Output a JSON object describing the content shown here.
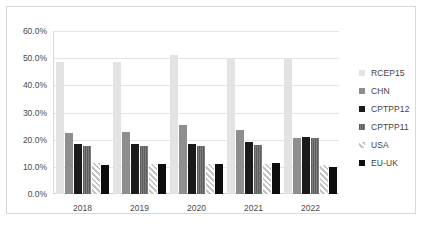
{
  "chart_data": {
    "type": "bar",
    "title": "",
    "xlabel": "",
    "ylabel": "",
    "categories": [
      "2018",
      "2019",
      "2020",
      "2021",
      "2022"
    ],
    "ylim": [
      0,
      60
    ],
    "ytick_values": [
      0,
      10,
      20,
      30,
      40,
      50,
      60
    ],
    "ytick_labels": [
      "0.0%",
      "10.0%",
      "20.0%",
      "30.0%",
      "40.0%",
      "50.0%",
      "60.0%"
    ],
    "grid": true,
    "legend_position": "right",
    "value_format": "percent",
    "series": [
      {
        "name": "RCEP15",
        "color": "#e3e3e3",
        "values": [
          48.5,
          48.5,
          51.0,
          50.0,
          50.0
        ]
      },
      {
        "name": "CHN",
        "color": "#8e8e8e",
        "values": [
          22.5,
          23.0,
          25.5,
          23.5,
          20.5
        ]
      },
      {
        "name": "CPTPP12",
        "color": "#1a1a1a",
        "values": [
          18.5,
          18.5,
          18.5,
          19.0,
          21.0
        ]
      },
      {
        "name": "CPTPP11",
        "color": "#6e6e6e",
        "values": [
          17.5,
          17.5,
          17.5,
          18.0,
          20.5
        ]
      },
      {
        "name": "USA",
        "color": "#d5d5d5",
        "values": [
          11.5,
          11.0,
          11.0,
          11.0,
          10.5
        ]
      },
      {
        "name": "EU-UK",
        "color": "#0d0d0d",
        "values": [
          10.5,
          11.0,
          11.0,
          11.5,
          10.0
        ]
      }
    ]
  },
  "legend": {
    "items": [
      {
        "label": "RCEP15"
      },
      {
        "label": "CHN"
      },
      {
        "label": "CPTPP12"
      },
      {
        "label": "CPTPP11"
      },
      {
        "label": "USA"
      },
      {
        "label": "EU-UK"
      }
    ]
  }
}
